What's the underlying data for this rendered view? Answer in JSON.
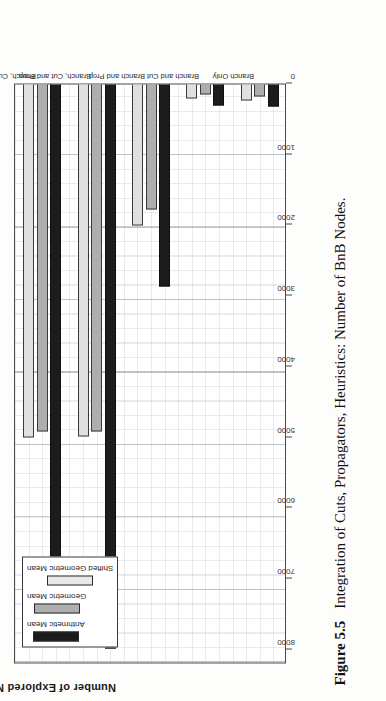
{
  "figure": {
    "number_label": "Figure 5.5",
    "caption_text": "Integration of Cuts, Propagators, Heuristics: Number of BnB Nodes."
  },
  "axis": {
    "value_axis_title": "Number of Explored Nodes"
  },
  "legend": {
    "entries": [
      {
        "label": "Arithmetic Mean",
        "color": "#1c1c1c"
      },
      {
        "label": "Geometric Mean",
        "color": "#aeaeae"
      },
      {
        "label": "Shifted Geometric Mean",
        "color": "#e8e8e8"
      }
    ]
  },
  "chart_data": {
    "type": "bar",
    "title": "",
    "subtitle": "",
    "orientation": "horizontal",
    "xlabel": "",
    "ylabel": "Number of Explored Nodes",
    "grid": true,
    "legend_position": "top-left",
    "axis_ticks": [
      "8000",
      "7000",
      "6000",
      "5000",
      "4000",
      "3000",
      "2000",
      "1000",
      "0"
    ],
    "axis_tick_values": [
      8000,
      7000,
      6000,
      5000,
      4000,
      3000,
      2000,
      1000,
      0
    ],
    "ylim": [
      0,
      8200
    ],
    "categories": [
      "Branch Only",
      "Branch and Cut",
      "Branch and Prop.",
      "Branch, Cut and Prop.",
      "Branch, Cut, Prop. and Heuristics"
    ],
    "series": [
      {
        "name": "Arithmetic Mean",
        "color": "#1c1c1c",
        "values": [
          340,
          330,
          2880,
          8000,
          7600
        ]
      },
      {
        "name": "Geometric Mean",
        "color": "#aeaeae",
        "values": [
          200,
          170,
          1800,
          4940,
          4930
        ]
      },
      {
        "name": "Shifted Geometric Mean",
        "color": "#e8e8e8",
        "values": [
          250,
          230,
          2020,
          5010,
          5020
        ]
      }
    ]
  }
}
